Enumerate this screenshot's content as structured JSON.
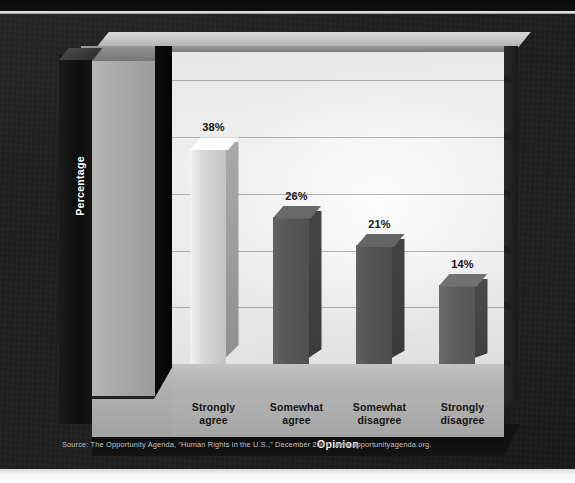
{
  "chart_data": {
    "type": "bar",
    "title": "",
    "categories": [
      "Strongly agree",
      "Somewhat agree",
      "Somewhat disagree",
      "Strongly disagree"
    ],
    "category_lines": [
      [
        "Strongly",
        "agree"
      ],
      [
        "Somewhat",
        "agree"
      ],
      [
        "Somewhat",
        "disagree"
      ],
      [
        "Strongly",
        "disagree"
      ]
    ],
    "values": [
      38,
      26,
      21,
      14
    ],
    "value_labels": [
      "38%",
      "26%",
      "21%",
      "14%"
    ],
    "xlabel": "Opinion",
    "ylabel": "Percentage",
    "ylim": [
      0,
      55
    ],
    "ytick_values": [
      0,
      10,
      20,
      30,
      40,
      50
    ],
    "ytick_labels": [
      "0%",
      "10%",
      "20%",
      "30%",
      "40%",
      "50%"
    ],
    "grid": true,
    "grid_axis": "y",
    "legend": "none",
    "style": "3d-column",
    "bar_colors": [
      "#d9d9d9",
      "#595959",
      "#565656",
      "#606060"
    ],
    "plot_background": "#eaeaea",
    "page_background": "#1d1d1d"
  },
  "source": {
    "text": "Source: The Opportunity Agenda, “Human Rights in the U.S.,” December 2007.  www.opportunityagenda.org."
  },
  "colors": {
    "accent_light_bar": "#d9d9d9",
    "accent_dark_bar": "#585858",
    "plot_face": "#ebebeb",
    "axis_pillar": "#a9a9a9",
    "label_dark": "#151515",
    "label_light": "#ffffff",
    "backdrop": "#1d1d1d"
  }
}
